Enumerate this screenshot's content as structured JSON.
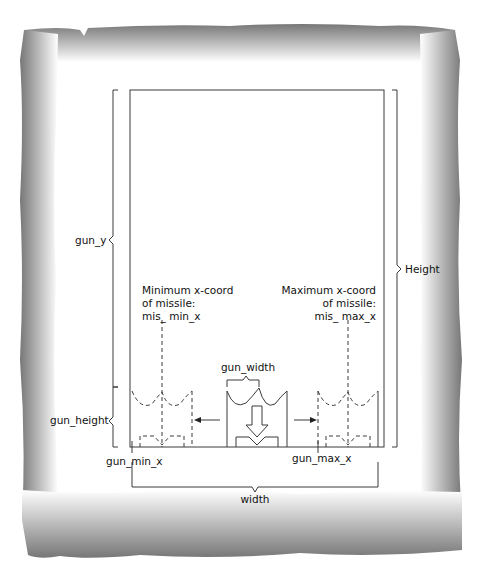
{
  "diagram": {
    "labels": {
      "gun_y": "gun_y",
      "height": "Height",
      "min_x_line1": "Minimum x-coord",
      "min_x_line2": "of missile:",
      "min_x_line3": "mis_ min_x",
      "max_x_line1": "Maximum x-coord",
      "max_x_line2": "of missile:",
      "max_x_line3": "mis_ max_x",
      "gun_width": "gun_width",
      "gun_height": "gun_height",
      "gun_min_x": "gun_min_x",
      "gun_max_x": "gun_max_x",
      "width": "width"
    },
    "colors": {
      "line": "#3a3a3a",
      "border_dark": "#6e6e6e",
      "border_light": "#ffffff"
    }
  }
}
